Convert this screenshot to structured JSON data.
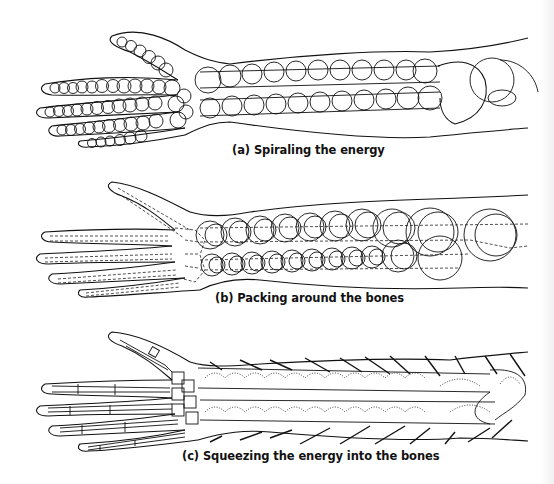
{
  "figure": {
    "panels": [
      {
        "id": "a",
        "caption": "(a) Spiraling the energy",
        "illustration": "arm-skeleton-with-spiral-coils"
      },
      {
        "id": "b",
        "caption": "(b) Packing around the bones",
        "illustration": "arm-with-dashed-bones-and-stacked-rings"
      },
      {
        "id": "c",
        "caption": "(c) Squeezing the energy into the bones",
        "illustration": "arm-skeleton-with-inward-arrows"
      }
    ],
    "colors": {
      "ink": "#111111",
      "background": "#ffffff"
    }
  }
}
